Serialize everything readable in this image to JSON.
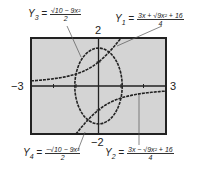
{
  "graph": {
    "window": {
      "xmin": -3,
      "xmax": 3,
      "ymin": -2,
      "ymax": 2
    },
    "labels": {
      "xmin": "−3",
      "xmax": "3",
      "ymax": "2",
      "ymin": "−2"
    },
    "screen_color": "#d4d4d4",
    "border_color": "#222222",
    "curve_color": "#222222"
  },
  "equations": {
    "y1": {
      "name": "Y",
      "sub": "1",
      "eq": " = ",
      "num": "3x + √9x² + 16",
      "den": "4"
    },
    "y2": {
      "name": "Y",
      "sub": "2",
      "eq": " = ",
      "num": "3x − √9x² + 16",
      "den": "4"
    },
    "y3": {
      "name": "Y",
      "sub": "3",
      "eq": " = ",
      "num": "√10 − 9x²",
      "den": "2"
    },
    "y4": {
      "name": "Y",
      "sub": "4",
      "eq": " = ",
      "num": "−√10 − 9x²",
      "den": "2"
    }
  }
}
